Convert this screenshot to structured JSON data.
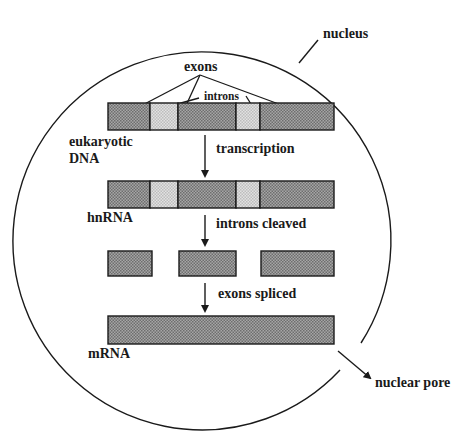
{
  "diagram": {
    "type": "process-flow",
    "colors": {
      "exon_fill": "#8f8f8f",
      "intron_fill": "#d4d4d4",
      "stroke": "#1a1a1a",
      "background": "#ffffff"
    },
    "labels": {
      "nucleus": "nucleus",
      "exons": "exons",
      "introns": "introns",
      "dna_line1": "eukaryotic",
      "dna_line2": "DNA",
      "hnrna": "hnRNA",
      "mrna": "mRNA",
      "nuclear_pore": "nuclear pore"
    },
    "steps": [
      {
        "label": "transcription"
      },
      {
        "label": "introns cleaved"
      },
      {
        "label": "exons spliced"
      }
    ],
    "stages": [
      {
        "name": "eukaryotic DNA",
        "segments": [
          {
            "type": "exon",
            "x": 108,
            "w": 42
          },
          {
            "type": "intron",
            "x": 150,
            "w": 28
          },
          {
            "type": "exon",
            "x": 178,
            "w": 58
          },
          {
            "type": "intron",
            "x": 236,
            "w": 24
          },
          {
            "type": "exon",
            "x": 260,
            "w": 74
          }
        ]
      },
      {
        "name": "hnRNA",
        "segments": [
          {
            "type": "exon",
            "x": 108,
            "w": 42
          },
          {
            "type": "intron",
            "x": 150,
            "w": 28
          },
          {
            "type": "exon",
            "x": 178,
            "w": 58
          },
          {
            "type": "intron",
            "x": 236,
            "w": 24
          },
          {
            "type": "exon",
            "x": 260,
            "w": 74
          }
        ]
      },
      {
        "name": "cleaved exons",
        "segments": [
          {
            "type": "exon",
            "x": 108,
            "w": 44
          },
          {
            "type": "exon",
            "x": 179,
            "w": 57
          },
          {
            "type": "exon",
            "x": 261,
            "w": 73
          }
        ]
      },
      {
        "name": "mRNA",
        "segments": [
          {
            "type": "exon",
            "x": 108,
            "w": 226
          }
        ]
      }
    ]
  }
}
